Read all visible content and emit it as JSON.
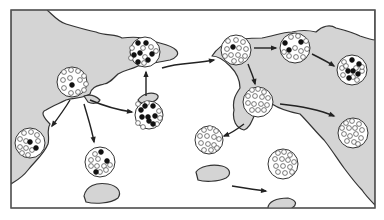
{
  "diagram": {
    "frame": {
      "x": 11,
      "y": 10,
      "w": 364,
      "h": 198,
      "border": "#555555"
    },
    "colors": {
      "land": "#d4d4d4",
      "outline": "#333333",
      "sea": "#ffffff",
      "dot_filled": "#111111",
      "dot_open": "#ffffff"
    },
    "landmasses": [
      {
        "name": "west-mainland",
        "d": "M11,10 L47,10 C52,14 58,22 66,24 C76,27 86,30 96,32 C106,36 116,34 122,38 C130,37 140,36 150,40 C160,44 170,44 176,50 C180,54 176,58 170,60 C160,62 148,64 138,66 C130,70 124,70 118,74 C112,80 108,84 104,84 C98,86 92,86 90,94 C84,98 74,98 66,100 C58,104 52,106 46,110 C40,112 44,118 50,124 C46,130 50,136 48,144 C44,154 36,160 28,170 C22,178 14,182 11,184 Z"
      },
      {
        "name": "west-islet",
        "d": "M84,96 C90,94 96,96 100,100 C98,104 92,104 88,102 Z"
      },
      {
        "name": "islet-center",
        "d": "M138,100 C142,94 150,92 156,94 C160,96 158,100 152,102 C146,104 140,104 138,100 Z"
      },
      {
        "name": "island-south",
        "d": "M84,196 C86,186 96,182 108,184 C118,186 122,192 118,198 C110,204 94,204 86,202 Z"
      },
      {
        "name": "east-mainland",
        "d": "M375,10 L375,205 C370,200 366,196 362,190 C356,184 350,176 344,168 C338,160 332,150 324,140 C316,132 308,122 300,114 C290,112 278,108 272,104 C268,112 262,116 256,112 C252,120 250,128 244,130 C236,128 232,120 234,110 C232,100 236,94 240,88 C240,80 236,72 230,66 C224,60 218,56 212,56 C216,50 222,44 230,42 C240,38 252,38 262,38 C274,36 282,32 292,32 C300,30 308,30 316,32 C322,26 330,24 336,28 C344,30 352,32 360,36 C366,38 372,40 375,40 Z"
      },
      {
        "name": "island-southwest",
        "d": "M196,172 C200,166 212,164 222,166 C230,168 232,174 226,178 C218,182 204,182 198,180 Z"
      },
      {
        "name": "island-southeast",
        "d": "M268,208 C268,202 276,198 288,198 C296,200 298,204 292,208 C284,212 272,212 268,208 Z"
      }
    ],
    "populations": [
      {
        "name": "source-west",
        "cx": 72,
        "cy": 82,
        "r": 15,
        "filled": [
          [
            72,
            85
          ]
        ],
        "open": [
          [
            64,
            72
          ],
          [
            71,
            70
          ],
          [
            78,
            71
          ],
          [
            84,
            76
          ],
          [
            63,
            80
          ],
          [
            70,
            78
          ],
          [
            80,
            80
          ],
          [
            86,
            84
          ],
          [
            64,
            88
          ],
          [
            71,
            93
          ],
          [
            78,
            92
          ],
          [
            84,
            90
          ]
        ]
      },
      {
        "name": "north-bay",
        "cx": 145,
        "cy": 52,
        "r": 15,
        "filled": [
          [
            138,
            43
          ],
          [
            146,
            43
          ],
          [
            134,
            55
          ],
          [
            140,
            53
          ],
          [
            152,
            54
          ],
          [
            148,
            60
          ],
          [
            138,
            62
          ]
        ],
        "open": [
          [
            132,
            48
          ],
          [
            143,
            48
          ],
          [
            151,
            47
          ],
          [
            156,
            51
          ],
          [
            145,
            57
          ],
          [
            131,
            58
          ],
          [
            144,
            63
          ]
        ]
      },
      {
        "name": "center-islet",
        "cx": 149,
        "cy": 115,
        "r": 14,
        "filled": [
          [
            141,
            110
          ],
          [
            145,
            106
          ],
          [
            153,
            106
          ],
          [
            142,
            117
          ],
          [
            148,
            117
          ],
          [
            155,
            116
          ],
          [
            149,
            121
          ],
          [
            153,
            124
          ]
        ],
        "open": [
          [
            138,
            104
          ],
          [
            147,
            103
          ],
          [
            159,
            111
          ],
          [
            160,
            118
          ],
          [
            138,
            123
          ],
          [
            143,
            127
          ],
          [
            157,
            124
          ]
        ]
      },
      {
        "name": "west-coast",
        "cx": 30,
        "cy": 143,
        "r": 15,
        "filled": [
          [
            30,
            142
          ],
          [
            36,
            148
          ]
        ],
        "open": [
          [
            24,
            133
          ],
          [
            31,
            132
          ],
          [
            37,
            135
          ],
          [
            20,
            139
          ],
          [
            26,
            141
          ],
          [
            38,
            141
          ],
          [
            20,
            147
          ],
          [
            26,
            148
          ],
          [
            32,
            150
          ],
          [
            22,
            153
          ],
          [
            28,
            155
          ]
        ]
      },
      {
        "name": "south-island",
        "cx": 100,
        "cy": 162,
        "r": 15,
        "filled": [
          [
            101,
            152
          ],
          [
            107,
            161
          ],
          [
            96,
            172
          ]
        ],
        "open": [
          [
            95,
            154
          ],
          [
            91,
            160
          ],
          [
            98,
            159
          ],
          [
            104,
            166
          ],
          [
            91,
            166
          ],
          [
            97,
            166
          ],
          [
            110,
            165
          ],
          [
            100,
            172
          ],
          [
            106,
            170
          ]
        ]
      },
      {
        "name": "east-landing",
        "cx": 236,
        "cy": 50,
        "r": 15,
        "filled": [
          [
            233,
            47
          ]
        ],
        "open": [
          [
            228,
            41
          ],
          [
            236,
            40
          ],
          [
            243,
            42
          ],
          [
            227,
            49
          ],
          [
            239,
            48
          ],
          [
            246,
            49
          ],
          [
            225,
            56
          ],
          [
            231,
            55
          ],
          [
            238,
            55
          ],
          [
            245,
            56
          ],
          [
            234,
            61
          ],
          [
            241,
            60
          ]
        ]
      },
      {
        "name": "east-north",
        "cx": 295,
        "cy": 48,
        "r": 15,
        "filled": [
          [
            285,
            43
          ],
          [
            301,
            42
          ],
          [
            289,
            50
          ]
        ],
        "open": [
          [
            291,
            37
          ],
          [
            298,
            36
          ],
          [
            306,
            41
          ],
          [
            284,
            52
          ],
          [
            295,
            48
          ],
          [
            301,
            51
          ],
          [
            289,
            56
          ],
          [
            296,
            57
          ],
          [
            303,
            57
          ],
          [
            307,
            49
          ]
        ]
      },
      {
        "name": "east-far",
        "cx": 352,
        "cy": 70,
        "r": 15,
        "filled": [
          [
            352,
            60
          ],
          [
            359,
            64
          ],
          [
            348,
            71
          ],
          [
            353,
            71
          ],
          [
            358,
            74
          ],
          [
            349,
            78
          ]
        ],
        "open": [
          [
            344,
            62
          ],
          [
            342,
            68
          ],
          [
            346,
            66
          ],
          [
            356,
            68
          ],
          [
            362,
            71
          ],
          [
            343,
            75
          ],
          [
            353,
            77
          ],
          [
            357,
            80
          ],
          [
            362,
            67
          ]
        ]
      },
      {
        "name": "east-south-coast",
        "cx": 258,
        "cy": 102,
        "r": 15,
        "filled": [],
        "open": [
          [
            252,
            90
          ],
          [
            258,
            89
          ],
          [
            264,
            92
          ],
          [
            248,
            96
          ],
          [
            255,
            96
          ],
          [
            262,
            97
          ],
          [
            268,
            98
          ],
          [
            248,
            103
          ],
          [
            254,
            104
          ],
          [
            261,
            104
          ],
          [
            267,
            105
          ],
          [
            252,
            110
          ],
          [
            258,
            110
          ],
          [
            264,
            110
          ]
        ]
      },
      {
        "name": "southeast-coast",
        "cx": 353,
        "cy": 133,
        "r": 15,
        "filled": [],
        "open": [
          [
            346,
            123
          ],
          [
            352,
            121
          ],
          [
            359,
            124
          ],
          [
            342,
            128
          ],
          [
            349,
            128
          ],
          [
            355,
            128
          ],
          [
            362,
            130
          ],
          [
            344,
            134
          ],
          [
            350,
            136
          ],
          [
            356,
            134
          ],
          [
            361,
            138
          ],
          [
            347,
            141
          ],
          [
            354,
            142
          ],
          [
            358,
            144
          ]
        ]
      },
      {
        "name": "southwest-island",
        "cx": 209,
        "cy": 140,
        "r": 14,
        "filled": [],
        "open": [
          [
            204,
            130
          ],
          [
            210,
            128
          ],
          [
            216,
            131
          ],
          [
            200,
            136
          ],
          [
            207,
            136
          ],
          [
            214,
            137
          ],
          [
            219,
            139
          ],
          [
            201,
            143
          ],
          [
            208,
            144
          ],
          [
            214,
            145
          ],
          [
            204,
            150
          ],
          [
            211,
            150
          ],
          [
            217,
            148
          ]
        ]
      },
      {
        "name": "southeast-island",
        "cx": 283,
        "cy": 164,
        "r": 15,
        "filled": [],
        "open": [
          [
            278,
            153
          ],
          [
            284,
            152
          ],
          [
            290,
            155
          ],
          [
            275,
            159
          ],
          [
            282,
            159
          ],
          [
            288,
            160
          ],
          [
            294,
            162
          ],
          [
            276,
            166
          ],
          [
            283,
            166
          ],
          [
            290,
            167
          ],
          [
            278,
            172
          ],
          [
            285,
            173
          ],
          [
            292,
            172
          ]
        ]
      }
    ],
    "arrows": [
      {
        "name": "arrow-to-north-bay",
        "d": "M146,96 L146,72"
      },
      {
        "name": "arrow-to-center-islet",
        "d": "M90,100 C104,106 118,110 132,112"
      },
      {
        "name": "arrow-to-west-coast",
        "d": "M70,100 C64,110 58,118 52,126"
      },
      {
        "name": "arrow-to-south-island",
        "d": "M84,104 C88,118 92,130 94,142"
      },
      {
        "name": "arrow-to-east-landing",
        "d": "M162,68 C180,62 196,64 214,60"
      },
      {
        "name": "arrow-to-east-north",
        "d": "M254,48 C262,48 270,48 276,48"
      },
      {
        "name": "arrow-to-east-far",
        "d": "M312,54 C320,58 328,62 334,66"
      },
      {
        "name": "arrow-to-east-south-coast",
        "d": "M248,64 C251,72 254,78 255,84"
      },
      {
        "name": "arrow-to-southeast-coast",
        "d": "M280,104 C300,106 320,110 334,116"
      },
      {
        "name": "arrow-to-southwest-island",
        "d": "M244,124 C236,130 230,134 224,136"
      },
      {
        "name": "arrow-to-southeast-island",
        "d": "M232,186 C244,188 256,190 266,191"
      }
    ]
  }
}
